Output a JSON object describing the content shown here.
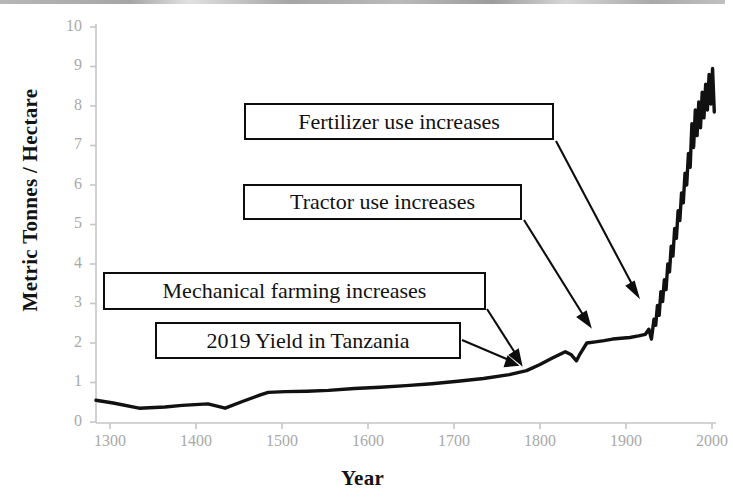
{
  "chart_data": {
    "type": "line",
    "title": "",
    "xlabel": "Year",
    "ylabel": "Metric Tonnes / Hectare",
    "xlim": [
      1300,
      2020
    ],
    "ylim": [
      0,
      10
    ],
    "xticks": [
      "1300",
      "1400",
      "1500",
      "1600",
      "1700",
      "1800",
      "1900",
      "2000"
    ],
    "yticks": [
      "0",
      "1",
      "2",
      "3",
      "4",
      "5",
      "6",
      "7",
      "8",
      "9",
      "10"
    ],
    "grid": false,
    "legend": "none",
    "series": [
      {
        "name": "Wheat yield",
        "x": [
          1300,
          1320,
          1350,
          1380,
          1400,
          1430,
          1450,
          1470,
          1490,
          1500,
          1520,
          1545,
          1570,
          1600,
          1630,
          1660,
          1690,
          1720,
          1750,
          1780,
          1800,
          1815,
          1830,
          1845,
          1852,
          1858,
          1862,
          1870,
          1880,
          1890,
          1900,
          1910,
          1920,
          1930,
          1938,
          1942,
          1945,
          1948,
          1950,
          1952,
          1954,
          1956,
          1958,
          1960,
          1962,
          1964,
          1966,
          1968,
          1970,
          1972,
          1974,
          1976,
          1978,
          1980,
          1982,
          1984,
          1986,
          1988,
          1990,
          1992,
          1994,
          1996,
          1998,
          2000,
          2002,
          2004,
          2006,
          2008,
          2010,
          2012,
          2014,
          2016,
          2018
        ],
        "y": [
          0.55,
          0.48,
          0.35,
          0.38,
          0.42,
          0.46,
          0.35,
          0.52,
          0.68,
          0.75,
          0.77,
          0.78,
          0.8,
          0.85,
          0.88,
          0.92,
          0.97,
          1.03,
          1.1,
          1.2,
          1.3,
          1.45,
          1.62,
          1.78,
          1.7,
          1.55,
          1.72,
          2.0,
          2.03,
          2.06,
          2.1,
          2.12,
          2.14,
          2.18,
          2.22,
          2.35,
          2.1,
          2.6,
          2.45,
          2.95,
          2.7,
          3.3,
          3.05,
          3.6,
          3.35,
          4.0,
          3.8,
          4.45,
          4.2,
          4.9,
          4.65,
          5.35,
          5.1,
          5.8,
          5.55,
          6.3,
          6.0,
          6.8,
          6.45,
          7.55,
          6.95,
          7.9,
          7.25,
          8.1,
          7.45,
          8.35,
          7.7,
          8.55,
          7.9,
          8.8,
          8.05,
          8.95,
          7.85
        ]
      }
    ],
    "annotations": [
      {
        "id": "fertilizer",
        "label": "Fertilizer use increases",
        "target_year": 1947,
        "target_value": 3.25
      },
      {
        "id": "tractor",
        "label": "Tractor use increases",
        "target_year": 1872,
        "target_value": 2.05
      },
      {
        "id": "mechanical",
        "label": "Mechanical farming increases",
        "target_year": 1805,
        "target_value": 1.42
      },
      {
        "id": "tanzania",
        "label": "2019 Yield in Tanzania",
        "target_year": 1797,
        "target_value": 1.3
      }
    ]
  },
  "axis": {
    "y_title": "Metric Tonnes / Hectare",
    "x_title": "Year",
    "y_tick_labels": [
      "10",
      "9",
      "8",
      "7",
      "6",
      "5",
      "4",
      "3",
      "2",
      "1",
      "0"
    ],
    "x_tick_labels": [
      "1300",
      "1400",
      "1500",
      "1600",
      "1700",
      "1800",
      "1900",
      "2000"
    ]
  },
  "annotations": {
    "fertilizer": {
      "label": "Fertilizer use increases"
    },
    "tractor": {
      "label": "Tractor use increases"
    },
    "mechanical": {
      "label": "Mechanical farming increases"
    },
    "tanzania": {
      "label": "2019 Yield in Tanzania"
    }
  },
  "colors": {
    "line": "#111111",
    "axis": "#c2c2c2",
    "tick_text": "#a9a9a9",
    "title_text": "#131313",
    "box_border": "#0d0d0d",
    "background": "#ffffff"
  }
}
